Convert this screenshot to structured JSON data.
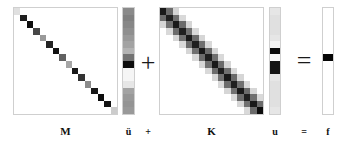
{
  "figure": {
    "equation": "M ü + K u = f",
    "background_color": "#ffffff",
    "border_color": "#cfcfcf",
    "ink_color": "#111111"
  },
  "labels": {
    "mass_matrix": "M",
    "acceleration_vector": "ü",
    "plus_small": "+",
    "stiffness_matrix": "K",
    "displacement_vector": "u",
    "equals_small": "=",
    "force_vector": "f"
  },
  "operators": {
    "plus_large": "+",
    "equals_large": "="
  },
  "chart_data": [
    {
      "type": "heatmap",
      "name": "M",
      "title": "M",
      "role": "mass-matrix",
      "rows": 16,
      "cols": 16,
      "colormap": "grayscale-inverted",
      "vmin": 0,
      "vmax": 1,
      "pattern": "diagonal",
      "values": [
        [
          0.12,
          0,
          0,
          0,
          0,
          0,
          0,
          0,
          0,
          0,
          0,
          0,
          0,
          0,
          0,
          0
        ],
        [
          0,
          0.88,
          0,
          0,
          0,
          0,
          0,
          0,
          0,
          0,
          0,
          0,
          0,
          0,
          0,
          0
        ],
        [
          0,
          0,
          0.95,
          0,
          0,
          0,
          0,
          0,
          0,
          0,
          0,
          0,
          0,
          0,
          0,
          0
        ],
        [
          0,
          0,
          0,
          0.72,
          0,
          0,
          0,
          0,
          0,
          0,
          0,
          0,
          0,
          0,
          0,
          0
        ],
        [
          0,
          0,
          0,
          0,
          0.4,
          0,
          0,
          0,
          0,
          0,
          0,
          0,
          0,
          0,
          0,
          0
        ],
        [
          0,
          0,
          0,
          0,
          0,
          0.86,
          0,
          0,
          0,
          0,
          0,
          0,
          0,
          0,
          0,
          0
        ],
        [
          0,
          0,
          0,
          0,
          0,
          0,
          0.93,
          0,
          0,
          0,
          0,
          0,
          0,
          0,
          0,
          0
        ],
        [
          0,
          0,
          0,
          0,
          0,
          0,
          0,
          0.62,
          0,
          0,
          0,
          0,
          0,
          0,
          0,
          0
        ],
        [
          0,
          0,
          0,
          0,
          0,
          0,
          0,
          0,
          0.35,
          0,
          0,
          0,
          0,
          0,
          0,
          0
        ],
        [
          0,
          0,
          0,
          0,
          0,
          0,
          0,
          0,
          0,
          0.9,
          0,
          0,
          0,
          0,
          0,
          0
        ],
        [
          0,
          0,
          0,
          0,
          0,
          0,
          0,
          0,
          0,
          0,
          0.8,
          0,
          0,
          0,
          0,
          0
        ],
        [
          0,
          0,
          0,
          0,
          0,
          0,
          0,
          0,
          0,
          0,
          0,
          0.45,
          0,
          0,
          0,
          0
        ],
        [
          0,
          0,
          0,
          0,
          0,
          0,
          0,
          0,
          0,
          0,
          0,
          0,
          0.9,
          0,
          0,
          0
        ],
        [
          0,
          0,
          0,
          0,
          0,
          0,
          0,
          0,
          0,
          0,
          0,
          0,
          0,
          0.95,
          0,
          0
        ],
        [
          0,
          0,
          0,
          0,
          0,
          0,
          0,
          0,
          0,
          0,
          0,
          0,
          0,
          0,
          0.92,
          0
        ],
        [
          0,
          0,
          0,
          0,
          0,
          0,
          0,
          0,
          0,
          0,
          0,
          0,
          0,
          0,
          0,
          0.2
        ]
      ]
    },
    {
      "type": "heatmap",
      "name": "udd",
      "title": "ü",
      "role": "acceleration-vector",
      "rows": 16,
      "cols": 1,
      "colormap": "grayscale-inverted",
      "vmin": 0,
      "vmax": 1,
      "pattern": "column",
      "values": [
        0.46,
        0.5,
        0.47,
        0.44,
        0.4,
        0.36,
        0.3,
        0.55,
        0.95,
        0.04,
        0.04,
        0.1,
        0.36,
        0.4,
        0.42,
        0.4
      ]
    },
    {
      "type": "heatmap",
      "name": "K",
      "title": "K",
      "role": "stiffness-matrix",
      "rows": 16,
      "cols": 16,
      "colormap": "grayscale-inverted",
      "vmin": 0,
      "vmax": 1,
      "pattern": "banded-tridiagonal",
      "band_values": {
        "main": 0.88,
        "off1": 0.55,
        "off2": 0.18
      },
      "values": [
        [
          0.9,
          0.58,
          0.16,
          0,
          0,
          0,
          0,
          0,
          0,
          0,
          0,
          0,
          0,
          0,
          0,
          0
        ],
        [
          0.58,
          0.88,
          0.56,
          0.15,
          0,
          0,
          0,
          0,
          0,
          0,
          0,
          0,
          0,
          0,
          0,
          0
        ],
        [
          0.16,
          0.56,
          0.9,
          0.58,
          0.16,
          0,
          0,
          0,
          0,
          0,
          0,
          0,
          0,
          0,
          0,
          0
        ],
        [
          0,
          0.15,
          0.58,
          0.88,
          0.56,
          0.15,
          0,
          0,
          0,
          0,
          0,
          0,
          0,
          0,
          0,
          0
        ],
        [
          0,
          0,
          0.16,
          0.56,
          0.9,
          0.58,
          0.16,
          0,
          0,
          0,
          0,
          0,
          0,
          0,
          0,
          0
        ],
        [
          0,
          0,
          0,
          0.15,
          0.58,
          0.88,
          0.56,
          0.15,
          0,
          0,
          0,
          0,
          0,
          0,
          0,
          0
        ],
        [
          0,
          0,
          0,
          0,
          0.16,
          0.56,
          0.9,
          0.58,
          0.16,
          0,
          0,
          0,
          0,
          0,
          0,
          0
        ],
        [
          0,
          0,
          0,
          0,
          0,
          0.15,
          0.58,
          0.88,
          0.56,
          0.15,
          0,
          0,
          0,
          0,
          0,
          0
        ],
        [
          0,
          0,
          0,
          0,
          0,
          0,
          0.16,
          0.56,
          0.9,
          0.58,
          0.16,
          0,
          0,
          0,
          0,
          0
        ],
        [
          0,
          0,
          0,
          0,
          0,
          0,
          0,
          0.15,
          0.58,
          0.88,
          0.56,
          0.15,
          0,
          0,
          0,
          0
        ],
        [
          0,
          0,
          0,
          0,
          0,
          0,
          0,
          0,
          0.16,
          0.56,
          0.9,
          0.58,
          0.16,
          0,
          0,
          0
        ],
        [
          0,
          0,
          0,
          0,
          0,
          0,
          0,
          0,
          0,
          0.15,
          0.58,
          0.88,
          0.56,
          0.15,
          0,
          0
        ],
        [
          0,
          0,
          0,
          0,
          0,
          0,
          0,
          0,
          0,
          0,
          0.16,
          0.56,
          0.9,
          0.58,
          0.16,
          0
        ],
        [
          0,
          0,
          0,
          0,
          0,
          0,
          0,
          0,
          0,
          0,
          0,
          0.15,
          0.58,
          0.88,
          0.56,
          0.15
        ],
        [
          0,
          0,
          0,
          0,
          0,
          0,
          0,
          0,
          0,
          0,
          0,
          0,
          0.16,
          0.56,
          0.9,
          0.58
        ],
        [
          0,
          0,
          0,
          0,
          0,
          0,
          0,
          0,
          0,
          0,
          0,
          0,
          0,
          0.15,
          0.58,
          0.95
        ]
      ]
    },
    {
      "type": "heatmap",
      "name": "u",
      "title": "u",
      "role": "displacement-vector",
      "rows": 16,
      "cols": 1,
      "colormap": "grayscale-inverted",
      "vmin": 0,
      "vmax": 1,
      "pattern": "column",
      "values": [
        0.1,
        0.12,
        0.12,
        0.12,
        0.1,
        0.04,
        0.95,
        0.02,
        0.92,
        0.92,
        0.1,
        0.12,
        0.12,
        0.12,
        0.12,
        0.1
      ]
    },
    {
      "type": "heatmap",
      "name": "f",
      "title": "f",
      "role": "force-vector",
      "rows": 16,
      "cols": 1,
      "colormap": "grayscale-inverted",
      "vmin": 0,
      "vmax": 1,
      "pattern": "column-single-spike",
      "values": [
        0,
        0,
        0,
        0,
        0,
        0,
        0,
        0.98,
        0,
        0,
        0,
        0,
        0,
        0,
        0,
        0
      ]
    }
  ]
}
